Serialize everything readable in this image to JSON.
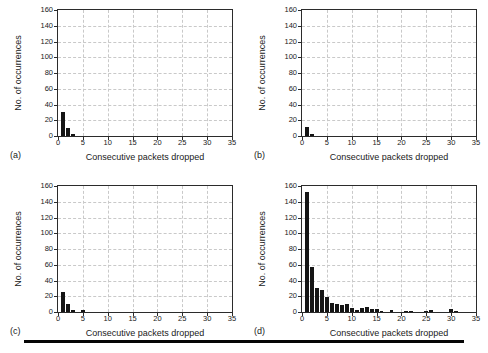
{
  "figure": {
    "panels": [
      {
        "key": "a",
        "label": "(a)",
        "xlabel": "Consecutive packets dropped",
        "ylabel": "No. of occurrences"
      },
      {
        "key": "b",
        "label": "(b)",
        "xlabel": "Consecutive packets dropped",
        "ylabel": "No. of occurrences"
      },
      {
        "key": "c",
        "label": "(c)",
        "xlabel": "Consecutive packets dropped",
        "ylabel": "No. of occurrences"
      },
      {
        "key": "d",
        "label": "(d)",
        "xlabel": "Consecutive packets dropped",
        "ylabel": "No. of occurrences"
      }
    ],
    "bottom_rule": true
  },
  "chart_data": [
    {
      "type": "bar",
      "panel": "(a)",
      "title": "",
      "xlabel": "Consecutive packets dropped",
      "ylabel": "No. of occurrences",
      "xlim": [
        0,
        35
      ],
      "ylim": [
        0,
        160
      ],
      "xticks": [
        0,
        5,
        10,
        15,
        20,
        25,
        30,
        35
      ],
      "yticks": [
        0,
        20,
        40,
        60,
        80,
        100,
        120,
        140,
        160
      ],
      "grid": true,
      "legend": "none",
      "bar_color": "#151515",
      "x": [
        1,
        2,
        3
      ],
      "values": [
        30,
        10,
        2
      ]
    },
    {
      "type": "bar",
      "panel": "(b)",
      "title": "",
      "xlabel": "Consecutive packets dropped",
      "ylabel": "No. of occurrences",
      "xlim": [
        0,
        35
      ],
      "ylim": [
        0,
        160
      ],
      "xticks": [
        0,
        5,
        10,
        15,
        20,
        25,
        30,
        35
      ],
      "yticks": [
        0,
        20,
        40,
        60,
        80,
        100,
        120,
        140,
        160
      ],
      "grid": true,
      "legend": "none",
      "bar_color": "#151515",
      "x": [
        1,
        2
      ],
      "values": [
        12,
        2
      ]
    },
    {
      "type": "bar",
      "panel": "(c)",
      "title": "",
      "xlabel": "Consecutive packets dropped",
      "ylabel": "No. of occurrences",
      "xlim": [
        0,
        35
      ],
      "ylim": [
        0,
        160
      ],
      "xticks": [
        0,
        5,
        10,
        15,
        20,
        25,
        30,
        35
      ],
      "yticks": [
        0,
        20,
        40,
        60,
        80,
        100,
        120,
        140,
        160
      ],
      "grid": true,
      "legend": "none",
      "bar_color": "#151515",
      "x": [
        1,
        2,
        3,
        5
      ],
      "values": [
        25,
        10,
        2,
        3
      ]
    },
    {
      "type": "bar",
      "panel": "(d)",
      "title": "",
      "xlabel": "Consecutive packets dropped",
      "ylabel": "No. of occurrences",
      "xlim": [
        0,
        35
      ],
      "ylim": [
        0,
        160
      ],
      "xticks": [
        0,
        5,
        10,
        15,
        20,
        25,
        30,
        35
      ],
      "yticks": [
        0,
        20,
        40,
        60,
        80,
        100,
        120,
        140,
        160
      ],
      "grid": true,
      "legend": "none",
      "bar_color": "#151515",
      "x": [
        1,
        2,
        3,
        4,
        5,
        6,
        7,
        8,
        9,
        10,
        11,
        12,
        13,
        14,
        15,
        16,
        18,
        21,
        22,
        25,
        26,
        30,
        31
      ],
      "values": [
        152,
        57,
        30,
        28,
        19,
        11,
        10,
        9,
        10,
        5,
        2,
        5,
        6,
        4,
        4,
        1,
        3,
        1,
        1,
        1,
        2,
        4,
        1
      ]
    }
  ]
}
